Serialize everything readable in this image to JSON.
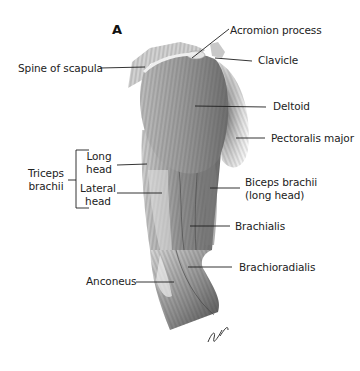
{
  "figure": {
    "panel_letter": "A",
    "signature": "JVH"
  },
  "labels": {
    "acromion_process": "Acromion process",
    "clavicle": "Clavicle",
    "spine_of_scapula": "Spine of scapula",
    "deltoid": "Deltoid",
    "pectoralis_major": "Pectoralis major",
    "triceps_brachii": {
      "line1": "Triceps",
      "line2": "brachii"
    },
    "long_head": {
      "line1": "Long",
      "line2": "head"
    },
    "lateral_head": {
      "line1": "Lateral",
      "line2": "head"
    },
    "biceps_brachii": {
      "line1": "Biceps brachii",
      "line2": "(long head)"
    },
    "brachialis": "Brachialis",
    "brachioradialis": "Brachioradialis",
    "anconeus": "Anconeus"
  },
  "colors": {
    "background": "#ffffff",
    "leader_line": "#1e1e1e",
    "muscle_dark": "#5a5a5a",
    "muscle_mid": "#9a9a9a",
    "muscle_light": "#d8d8d8"
  }
}
